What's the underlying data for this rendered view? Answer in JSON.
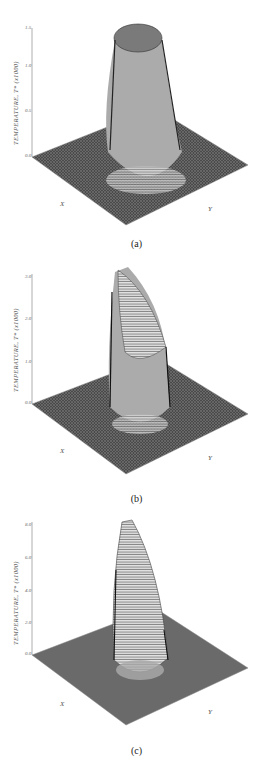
{
  "figure": {
    "panels": [
      {
        "caption": "(a)",
        "zlabel": "TEMPERATURE,  T* (x1000)",
        "zticks": [
          "0.0",
          "0.5",
          "1.0",
          "1.5"
        ],
        "xlabel": "X",
        "ylabel": "Y",
        "xticks": [
          "3",
          "2",
          "1",
          "0",
          "-1",
          "-2",
          "-3"
        ],
        "yticks": [
          "-3",
          "-2",
          "-1",
          "0",
          "1",
          "2",
          "3"
        ]
      },
      {
        "caption": "(b)",
        "zlabel": "TEMPERATURE,  T* (x1000)",
        "zticks": [
          "0.0",
          "1.0",
          "2.0",
          "3.0"
        ],
        "xlabel": "X",
        "ylabel": "Y",
        "xticks": [
          "3",
          "2",
          "1",
          "0",
          "-1",
          "-2",
          "-3"
        ],
        "yticks": [
          "-3",
          "-2",
          "-1",
          "0",
          "1",
          "2",
          "3"
        ]
      },
      {
        "caption": "(c)",
        "zlabel": "TEMPERATURE,  T* (x1000)",
        "zticks": [
          "0.0",
          "2.0",
          "4.0",
          "6.0",
          "8.0"
        ],
        "xlabel": "X",
        "ylabel": "Y",
        "xticks": [
          "3",
          "2",
          "1",
          "0",
          "-1",
          "-2",
          "-3"
        ],
        "yticks": [
          "-3",
          "-2",
          "-1",
          "0",
          "1",
          "2",
          "3"
        ]
      }
    ]
  }
}
